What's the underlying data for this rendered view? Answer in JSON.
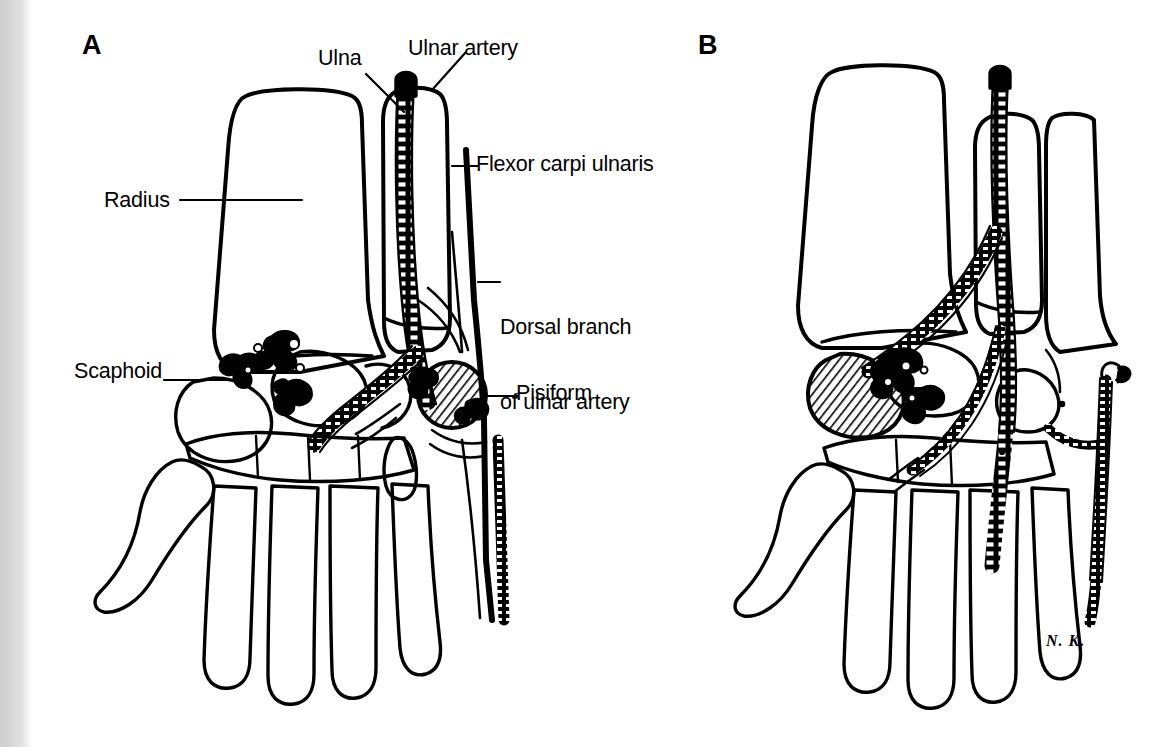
{
  "figure": {
    "background_color": "#ffffff",
    "ink_color": "#000000",
    "edge_band_color": "#d2d2d2",
    "signature": "N. K."
  },
  "panels": [
    {
      "id": "A",
      "letter": "A",
      "labels": [
        {
          "id": "ulna",
          "text": "Ulna"
        },
        {
          "id": "ulnar_artery",
          "text": "Ulnar artery"
        },
        {
          "id": "radius",
          "text": "Radius"
        },
        {
          "id": "fcu",
          "text": "Flexor carpi ulnaris"
        },
        {
          "id": "dorsal_branch_line1",
          "text": "Dorsal branch"
        },
        {
          "id": "dorsal_branch_line2",
          "text": "of ulnar artery"
        },
        {
          "id": "scaphoid",
          "text": "Scaphoid"
        },
        {
          "id": "pisiform",
          "text": "Pisiform"
        }
      ]
    },
    {
      "id": "B",
      "letter": "B",
      "labels": []
    }
  ]
}
